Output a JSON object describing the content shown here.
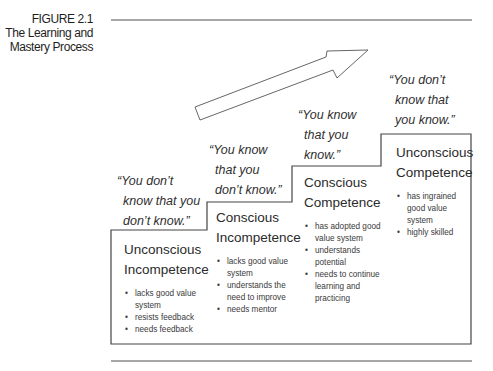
{
  "figure": {
    "number": "FIGURE 2.1",
    "title_lines": [
      "The Learning and",
      "Mastery Process"
    ]
  },
  "colors": {
    "line": "#444444",
    "rule": "#8a8a8a",
    "text": "#2b2b2b"
  },
  "arrow": {
    "icon": "arrow-up-right-icon",
    "direction": "upward-right"
  },
  "stages": [
    {
      "quote_lines": [
        "“You don’t",
        "know that you",
        "don’t know.”"
      ],
      "title_lines": [
        "Unconscious",
        "Incompetence"
      ],
      "bullets": [
        [
          "lacks good value",
          "system"
        ],
        [
          "resists feedback"
        ],
        [
          "needs feedback"
        ]
      ]
    },
    {
      "quote_lines": [
        "“You know",
        "that you",
        "don’t know.”"
      ],
      "title_lines": [
        "Conscious",
        "Incompetence"
      ],
      "bullets": [
        [
          "lacks good value",
          "system"
        ],
        [
          "understands the",
          "need to improve"
        ],
        [
          "needs mentor"
        ]
      ]
    },
    {
      "quote_lines": [
        "“You know",
        "that you",
        "know.”"
      ],
      "title_lines": [
        "Conscious",
        "Competence"
      ],
      "bullets": [
        [
          "has adopted good",
          "value system"
        ],
        [
          "understands",
          "potential"
        ],
        [
          "needs to continue",
          "learning and",
          "practicing"
        ]
      ]
    },
    {
      "quote_lines": [
        "“You don’t",
        "know that",
        "you know.”"
      ],
      "title_lines": [
        "Unconscious",
        "Competence"
      ],
      "bullets": [
        [
          "has ingrained",
          "good value",
          "system"
        ],
        [
          "highly skilled"
        ]
      ]
    }
  ]
}
